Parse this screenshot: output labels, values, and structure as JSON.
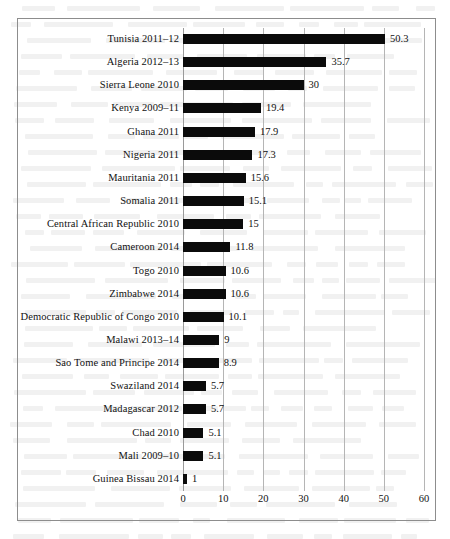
{
  "figure": {
    "frame_color": "#8d8d8d",
    "bar_color": "#0b0b0b",
    "gridline_color": "#b5b5b5"
  },
  "chart_data": {
    "type": "bar",
    "orientation": "horizontal",
    "title": "",
    "subtitle": "",
    "xlabel": "",
    "ylabel": "",
    "xlim": [
      0,
      60
    ],
    "xticks": [
      0,
      10,
      20,
      30,
      40,
      50,
      60
    ],
    "xtick_labels": [
      "0",
      "10",
      "20",
      "30",
      "40",
      "50",
      "60"
    ],
    "grid": true,
    "grid_axis": "x",
    "legend": false,
    "data_labels": true,
    "categories": [
      "Tunisia 2011–12",
      "Algeria 2012–13",
      "Sierra Leone 2010",
      "Kenya 2009–11",
      "Ghana 2011",
      "Nigeria 2011",
      "Mauritania 2011",
      "Somalia 2011",
      "Central African Republic 2010",
      "Cameroon 2014",
      "Togo 2010",
      "Zimbabwe 2014",
      "Democratic Republic of Congo 2010",
      "Malawi 2013–14",
      "Sao Tome and Principe 2014",
      "Swaziland 2014",
      "Madagascar 2012",
      "Chad 2010",
      "Mali 2009–10",
      "Guinea Bissau 2014"
    ],
    "values": [
      50.3,
      35.7,
      30,
      19.4,
      17.9,
      17.3,
      15.6,
      15.1,
      15,
      11.8,
      10.6,
      10.6,
      10.1,
      9,
      8.9,
      5.7,
      5.7,
      5.1,
      5.1,
      1
    ],
    "value_labels": [
      "50.3",
      "35.7",
      "30",
      "19.4",
      "17.9",
      "17.3",
      "15.6",
      "15.1",
      "15",
      "11.8",
      "10.6",
      "10.6",
      "10.1",
      "9",
      "8.9",
      "5.7",
      "5.7",
      "5.1",
      "5.1",
      "1"
    ]
  }
}
